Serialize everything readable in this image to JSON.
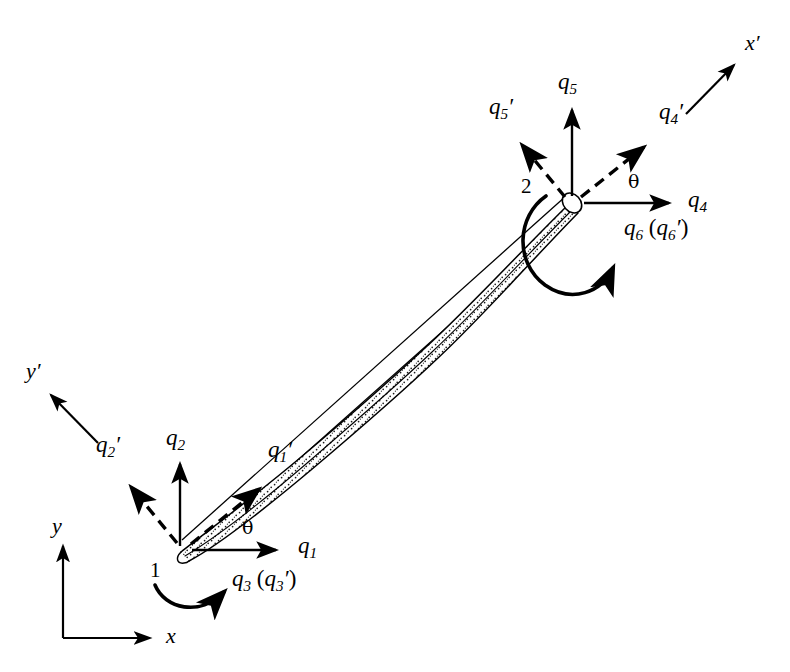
{
  "figure": {
    "background_color": "#ffffff",
    "stroke_color": "#000000",
    "stipple_color": "#000000"
  },
  "global_axes": {
    "x_label": "x",
    "y_label": "y",
    "origin": {
      "x": 63,
      "y": 638
    },
    "x_tip": {
      "x": 158,
      "y": 638
    },
    "y_tip": {
      "x": 63,
      "y": 538
    }
  },
  "local_axes": {
    "x_prime_label": "x",
    "x_prime_mark": "′",
    "y_prime_label": "y",
    "y_prime_mark": "′",
    "x_prime_start": {
      "x": 686,
      "y": 114
    },
    "x_prime_end": {
      "x": 739,
      "y": 60
    },
    "y_prime_start": {
      "x": 98,
      "y": 443
    },
    "y_prime_end": {
      "x": 46,
      "y": 390
    }
  },
  "nodes": [
    {
      "name": "node-1",
      "label": "1",
      "x": 180,
      "y": 550,
      "label_x": 150,
      "label_y": 562
    },
    {
      "name": "node-2",
      "label": "2",
      "x": 572,
      "y": 203,
      "label_x": 522,
      "label_y": 178
    }
  ],
  "theta_labels": [
    {
      "name": "theta-node-1",
      "text": "θ",
      "x": 242,
      "y": 523
    },
    {
      "name": "theta-node-2",
      "text": "θ",
      "x": 628,
      "y": 176
    }
  ],
  "dofs": [
    {
      "name": "q1",
      "symbol": "q",
      "subscript": "1",
      "prime": false,
      "type": "translation",
      "style": "solid",
      "frame": "global",
      "node": 1,
      "from": {
        "x": 190,
        "y": 550
      },
      "to": {
        "x": 281,
        "y": 550
      },
      "label_x": 297,
      "label_y": 538
    },
    {
      "name": "q2",
      "symbol": "q",
      "subscript": "2",
      "prime": false,
      "type": "translation",
      "style": "solid",
      "frame": "global",
      "node": 1,
      "from": {
        "x": 180,
        "y": 546
      },
      "to": {
        "x": 180,
        "y": 458
      },
      "label_x": 166,
      "label_y": 428
    },
    {
      "name": "q3",
      "symbol": "q",
      "subscript": "3",
      "prime": false,
      "type": "rotation",
      "style": "solid",
      "frame": "global",
      "node": 1,
      "label_x": 237,
      "label_y": 575,
      "paired_label": true
    },
    {
      "name": "q4",
      "symbol": "q",
      "subscript": "4",
      "prime": false,
      "type": "translation",
      "style": "solid",
      "frame": "global",
      "node": 2,
      "from": {
        "x": 583,
        "y": 203
      },
      "to": {
        "x": 674,
        "y": 203
      },
      "label_x": 690,
      "label_y": 192
    },
    {
      "name": "q5",
      "symbol": "q",
      "subscript": "5",
      "prime": false,
      "type": "translation",
      "style": "solid",
      "frame": "global",
      "node": 2,
      "from": {
        "x": 572,
        "y": 198
      },
      "to": {
        "x": 572,
        "y": 104
      },
      "label_x": 559,
      "label_y": 73
    },
    {
      "name": "q6",
      "symbol": "q",
      "subscript": "6",
      "prime": false,
      "type": "rotation",
      "style": "solid",
      "frame": "global",
      "node": 2,
      "label_x": 627,
      "label_y": 222,
      "paired_label": true
    },
    {
      "name": "q1-prime",
      "symbol": "q",
      "subscript": "1",
      "prime": true,
      "type": "translation",
      "style": "dashed",
      "frame": "local",
      "node": 1,
      "from": {
        "x": 190,
        "y": 543
      },
      "to": {
        "x": 265,
        "y": 483
      },
      "label_x": 272,
      "label_y": 445
    },
    {
      "name": "q2-prime",
      "symbol": "q",
      "subscript": "2",
      "prime": true,
      "type": "translation",
      "style": "dashed",
      "frame": "local",
      "node": 1,
      "from": {
        "x": 176,
        "y": 542
      },
      "to": {
        "x": 126,
        "y": 481
      },
      "label_x": 100,
      "label_y": 440
    },
    {
      "name": "q3-prime",
      "symbol": "q",
      "subscript": "3",
      "prime": true,
      "type": "rotation",
      "style": "solid",
      "frame": "local",
      "node": 1
    },
    {
      "name": "q4-prime",
      "symbol": "q",
      "subscript": "4",
      "prime": true,
      "type": "translation",
      "style": "dashed",
      "frame": "local",
      "node": 2,
      "from": {
        "x": 580,
        "y": 196
      },
      "to": {
        "x": 650,
        "y": 141
      },
      "label_x": 662,
      "label_y": 105
    },
    {
      "name": "q5-prime",
      "symbol": "q",
      "subscript": "5",
      "prime": true,
      "type": "translation",
      "style": "dashed",
      "frame": "local",
      "node": 2,
      "from": {
        "x": 566,
        "y": 196
      },
      "to": {
        "x": 517,
        "y": 139
      },
      "label_x": 491,
      "label_y": 100
    },
    {
      "name": "q6-prime",
      "symbol": "q",
      "subscript": "6",
      "prime": true,
      "type": "rotation",
      "style": "solid",
      "frame": "local",
      "node": 2
    }
  ],
  "label_texts": {
    "q1": "q1",
    "q2": "q2",
    "q3_pair": "q3 (q3′)",
    "q4": "q4",
    "q5": "q5",
    "q6_pair": "q6 (q6′)",
    "q1_prime": "q1′",
    "q2_prime": "q2′",
    "q4_prime": "q4′",
    "q5_prime": "q5′"
  },
  "beam": {
    "description": "deformed beam element drawn with stippled fill between node 1 and node 2, overlaid on straight undeformed chord",
    "node_start": 1,
    "node_end": 2,
    "fill_pattern": "stipple-dots",
    "outline_width": 1.4
  }
}
